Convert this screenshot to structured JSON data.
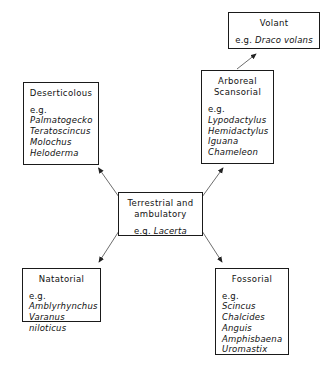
{
  "diagram": {
    "type": "locomotion-adaptive-radiation-flowchart",
    "nodes": {
      "center": {
        "title": "Terrestrial and\nambulatory",
        "eg": "e.g. ",
        "taxa": [
          "Lacerta"
        ]
      },
      "deserticolous": {
        "title": "Deserticolous",
        "eg": "e.g.",
        "taxa": [
          "Palmatogecko",
          "Teratoscincus",
          "Molochus",
          "Heloderma"
        ]
      },
      "arboreal": {
        "title": "Arboreal\nScansorial",
        "eg": "e.g.",
        "taxa": [
          "Lypodactylus",
          "Hemidactylus",
          "Iguana",
          "Chameleon"
        ]
      },
      "volant": {
        "title": "Volant",
        "eg": "e.g. ",
        "taxa": [
          "Draco volans"
        ]
      },
      "natatorial": {
        "title": "Natatorial",
        "eg": "e.g.",
        "taxa": [
          "Amblyrhynchus",
          "Varanus niloticus"
        ]
      },
      "fossorial": {
        "title": "Fossorial",
        "eg": "e.g.",
        "taxa": [
          "Scincus",
          "Chalcides",
          "Anguis",
          "Amphisbaena",
          "Uromastix"
        ]
      }
    },
    "edges": [
      {
        "name": "center-to-deserticolous",
        "from": "center",
        "to": "deserticolous"
      },
      {
        "name": "center-to-arboreal",
        "from": "center",
        "to": "arboreal"
      },
      {
        "name": "center-to-natatorial",
        "from": "center",
        "to": "natatorial"
      },
      {
        "name": "center-to-fossorial",
        "from": "center",
        "to": "fossorial"
      },
      {
        "name": "arboreal-to-volant",
        "from": "arboreal",
        "to": "volant"
      }
    ],
    "colors": {
      "stroke": "#1a1a1a",
      "arrow": "#555555",
      "background": "#ffffff",
      "text": "#111111"
    }
  }
}
